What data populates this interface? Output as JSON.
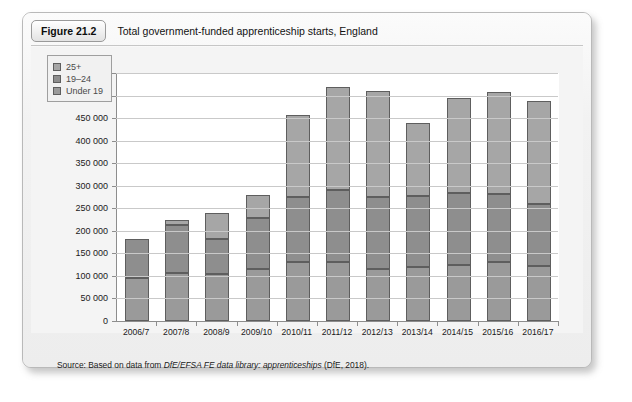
{
  "figure": {
    "badge": "Figure 21.2",
    "title": "Total government-funded apprenticeship starts, England",
    "source_prefix": "Source: Based on data from ",
    "source_italic": "DfE/EFSA FE data library: apprenticeships",
    "source_suffix": " (DfE, 2018)."
  },
  "colors": {
    "under19": "#9a9a9a",
    "age19_24": "#8e8e8e",
    "age25plus": "#a6a6a6",
    "bar_outline": "#5e5e5e",
    "gridline": "#c9c9c9",
    "axis": "#8d8d8d",
    "plot_background": "#ffffff",
    "card_background": "#f0f0f0"
  },
  "chart_data": {
    "type": "bar",
    "subtype": "stacked",
    "title": "Total government-funded apprenticeship starts, England",
    "xlabel": "",
    "ylabel": "",
    "ylim": [
      0,
      550000
    ],
    "ytick_step": 50000,
    "ytick_labels": [
      "0",
      "50 000",
      "100 000",
      "150 000",
      "200 000",
      "250 000",
      "300 000",
      "350 000",
      "400 000",
      "450 000",
      "500 000",
      "550 000"
    ],
    "ytick_values": [
      0,
      50000,
      100000,
      150000,
      200000,
      250000,
      300000,
      350000,
      400000,
      450000,
      500000,
      550000
    ],
    "grid": true,
    "legend_position": "top-left",
    "categories": [
      "2006/7",
      "2007/8",
      "2008/9",
      "2009/10",
      "2010/11",
      "2011/12",
      "2012/13",
      "2013/14",
      "2014/15",
      "2015/16",
      "2016/17"
    ],
    "series": [
      {
        "name": "Under 19",
        "values": [
          96000,
          106000,
          104000,
          116000,
          131000,
          130000,
          115000,
          119000,
          125000,
          131000,
          122000
        ]
      },
      {
        "name": "19–24",
        "values": [
          87000,
          108000,
          78000,
          113000,
          143000,
          161000,
          161000,
          159000,
          160000,
          151000,
          138000
        ]
      },
      {
        "name": "25+",
        "values": [
          0,
          10000,
          58000,
          50000,
          183000,
          229000,
          234000,
          162000,
          210000,
          225000,
          229000
        ]
      }
    ],
    "totals": [
      183000,
      224000,
      240000,
      279000,
      457000,
      520000,
      510000,
      440000,
      495000,
      507000,
      489000
    ]
  },
  "legend": {
    "items": [
      {
        "label": "25+",
        "key": "age25plus"
      },
      {
        "label": "19–24",
        "key": "age19_24"
      },
      {
        "label": "Under 19",
        "key": "under19"
      }
    ]
  }
}
